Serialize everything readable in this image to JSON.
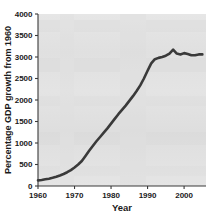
{
  "chart_data": {
    "type": "line",
    "title": "",
    "xlabel": "Year",
    "ylabel": "Percentage GDP growth from 1960",
    "xlim": [
      1960,
      2006
    ],
    "ylim": [
      0,
      4000
    ],
    "xticks": [
      1960,
      1970,
      1980,
      1990,
      2000
    ],
    "yticks": [
      0,
      500,
      1000,
      1500,
      2000,
      2500,
      3000,
      3500,
      4000
    ],
    "xtick_labels": [
      "1960",
      "1970",
      "1980",
      "1990",
      "2000"
    ],
    "ytick_labels": [
      "0",
      "500",
      "1000",
      "1500",
      "2000",
      "2500",
      "3000",
      "3500",
      "4000"
    ],
    "grid": false,
    "legend": null,
    "line_color": "#3a3a3a",
    "plot_background": "#e3e3e3",
    "series": [
      {
        "name": "Percentage GDP growth from 1960",
        "x": [
          1960,
          1961,
          1962,
          1963,
          1964,
          1965,
          1966,
          1967,
          1968,
          1969,
          1970,
          1971,
          1972,
          1973,
          1974,
          1975,
          1976,
          1977,
          1978,
          1979,
          1980,
          1981,
          1982,
          1983,
          1984,
          1985,
          1986,
          1987,
          1988,
          1989,
          1990,
          1991,
          1992,
          1993,
          1994,
          1995,
          1996,
          1997,
          1998,
          1999,
          2000,
          2001,
          2002,
          2003,
          2004,
          2005
        ],
        "values": [
          130,
          140,
          155,
          170,
          190,
          215,
          245,
          280,
          320,
          370,
          430,
          500,
          580,
          700,
          820,
          930,
          1040,
          1140,
          1240,
          1340,
          1450,
          1560,
          1670,
          1770,
          1870,
          1980,
          2090,
          2210,
          2340,
          2500,
          2680,
          2850,
          2950,
          2980,
          3000,
          3030,
          3080,
          3170,
          3080,
          3060,
          3090,
          3070,
          3040,
          3040,
          3060,
          3060
        ]
      }
    ]
  },
  "axes": {
    "y_title": "Percentage GDP growth from 1960",
    "x_title": "Year"
  }
}
